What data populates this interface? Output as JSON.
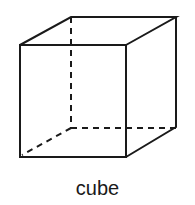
{
  "figure": {
    "label": "cube",
    "stroke_color": "#1a1a1a",
    "background": "#ffffff"
  }
}
